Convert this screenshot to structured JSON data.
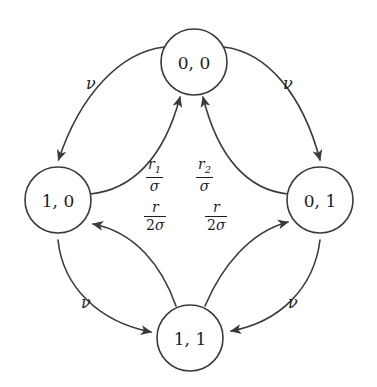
{
  "diagram": {
    "background_color": "#ffffff",
    "stroke_color": "#3b3b3b",
    "text_color": "#1d1d1d",
    "nodes": [
      {
        "id": "s00",
        "label": "0, 0",
        "cx": 194,
        "cy": 62,
        "r": 33
      },
      {
        "id": "s10",
        "label": "1, 0",
        "cx": 58,
        "cy": 200,
        "r": 33
      },
      {
        "id": "s01",
        "label": "0, 1",
        "cx": 320,
        "cy": 200,
        "r": 33
      },
      {
        "id": "s11",
        "label": "1, 1",
        "cx": 190,
        "cy": 338,
        "r": 33
      }
    ],
    "edges": [
      {
        "id": "e-00-10",
        "from": "0, 0",
        "to": "1, 0",
        "rate": "ν",
        "kind": "outer"
      },
      {
        "id": "e-00-01",
        "from": "0, 0",
        "to": "0, 1",
        "rate": "ν",
        "kind": "outer"
      },
      {
        "id": "e-10-11",
        "from": "1, 0",
        "to": "1, 1",
        "rate": "ν",
        "kind": "outer"
      },
      {
        "id": "e-01-11",
        "from": "0, 1",
        "to": "1, 1",
        "rate": "ν",
        "kind": "outer"
      },
      {
        "id": "e-10-00",
        "from": "1, 0",
        "to": "0, 0",
        "rate": "r_1/σ",
        "kind": "inner"
      },
      {
        "id": "e-01-00",
        "from": "0, 1",
        "to": "0, 0",
        "rate": "r_2/σ",
        "kind": "inner"
      },
      {
        "id": "e-11-10",
        "from": "1, 1",
        "to": "1, 0",
        "rate": "r/2σ",
        "kind": "inner"
      },
      {
        "id": "e-11-01",
        "from": "1, 1",
        "to": "0, 1",
        "rate": "r/2σ",
        "kind": "inner"
      }
    ],
    "labels": {
      "nu_top_left": "ν",
      "nu_top_right": "ν",
      "nu_bottom_left": "ν",
      "nu_bottom_right": "ν",
      "frac_r1_num": "r",
      "frac_r1_sub": "1",
      "frac_r1_den": "σ",
      "frac_r2_num": "r",
      "frac_r2_sub": "2",
      "frac_r2_den": "σ",
      "frac_rl_num": "r",
      "frac_rl_den_coef": "2",
      "frac_rl_den_sym": "σ",
      "frac_rr_num": "r",
      "frac_rr_den_coef": "2",
      "frac_rr_den_sym": "σ"
    }
  }
}
